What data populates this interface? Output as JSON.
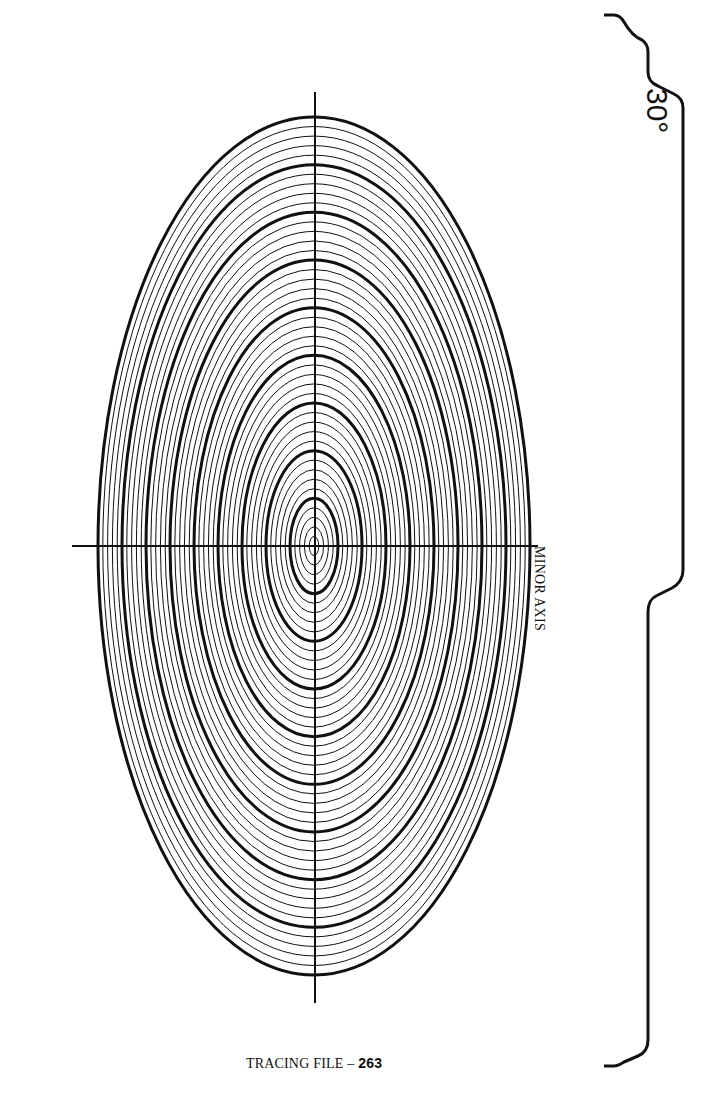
{
  "diagram": {
    "angle_label": "30°",
    "minor_axis_label": "MINOR AXIS",
    "footer": {
      "prefix": "TRACING FILE – ",
      "page_number": "263"
    },
    "ellipse_guide": {
      "center": [
        314,
        546
      ],
      "outer_semi_horizontal": 216,
      "outer_semi_vertical": 429,
      "ring_count": 45,
      "thick_every": 5,
      "axis_ratio": 0.5,
      "line_color": "#111111"
    },
    "axes": {
      "horizontal": {
        "x1": 72,
        "x2": 538,
        "y": 546
      },
      "vertical": {
        "x": 315,
        "y1": 92,
        "y2": 1003
      }
    }
  }
}
